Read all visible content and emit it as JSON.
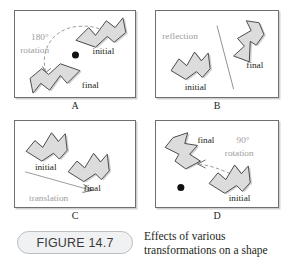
{
  "figure": {
    "number_label": "FIGURE 14.7",
    "caption_line_1": "Effects of various",
    "caption_line_2": "transformations on a shape",
    "colors": {
      "shape_fill": "#dcdcdc",
      "shape_stroke": "#4a4a4a",
      "panel_border": "#6f6f6f",
      "annotation_gray": "#9d9d9d",
      "pivot_dot": "#111111",
      "pill_background": "#f0f1f2",
      "pill_border": "#b9bec2"
    }
  },
  "panels": [
    {
      "letter": "A",
      "transformation": "rotation",
      "annotation_line_1": "180°",
      "annotation_line_2": "rotation",
      "shape_labels": {
        "before": "initial",
        "after": "final"
      },
      "has_pivot_dot": true,
      "has_dashed_arc": true
    },
    {
      "letter": "B",
      "transformation": "reflection",
      "annotation_line_1": "reflection",
      "annotation_line_2": "",
      "shape_labels": {
        "before": "initial",
        "after": "final"
      },
      "has_pivot_dot": false,
      "has_mirror_line": true
    },
    {
      "letter": "C",
      "transformation": "translation",
      "annotation_line_1": "translation",
      "annotation_line_2": "",
      "shape_labels": {
        "before": "initial",
        "after": "final"
      },
      "has_pivot_dot": false,
      "has_translation_arrow": true
    },
    {
      "letter": "D",
      "transformation": "rotation",
      "annotation_line_1": "90°",
      "annotation_line_2": "rotation",
      "shape_labels": {
        "before": "initial",
        "after": "final"
      },
      "has_pivot_dot": true,
      "has_dashed_arc": true
    }
  ]
}
